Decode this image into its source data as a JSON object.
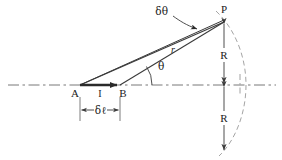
{
  "figure": {
    "background_color": "#ffffff",
    "stroke_color": "#3a3a3a",
    "text_color": "#1a1a1a",
    "width": 282,
    "height": 160
  },
  "labels": {
    "point_a": "A",
    "point_b": "B",
    "point_p": "P",
    "current": "I",
    "delta_theta": "δθ",
    "theta": "θ",
    "r": "r",
    "delta_l": "δℓ",
    "r_upper": "R",
    "r_lower": "R"
  },
  "geometry": {
    "axis_y": 85,
    "axis_x_start": 8,
    "axis_x_end": 276,
    "a_x": 80,
    "a_y": 85,
    "b_x": 120,
    "b_y": 85,
    "p_x": 224,
    "p_y": 22,
    "dim_line_y": 110,
    "arc_center_x": 120,
    "arc_radius": 119
  },
  "icons": {
    "current_arrow": "arrow-right-icon",
    "delta_theta_leader": "leader-arrow-icon",
    "r_upper_arrow": "arrow-up-icon",
    "r_lower_arrow": "arrow-down-icon",
    "dimension_arrows": "dimension-arrows-icon",
    "angle_arc": "angle-arc-icon",
    "field_arc": "dashed-arc-icon",
    "center_line": "dash-dot-axis-icon"
  }
}
